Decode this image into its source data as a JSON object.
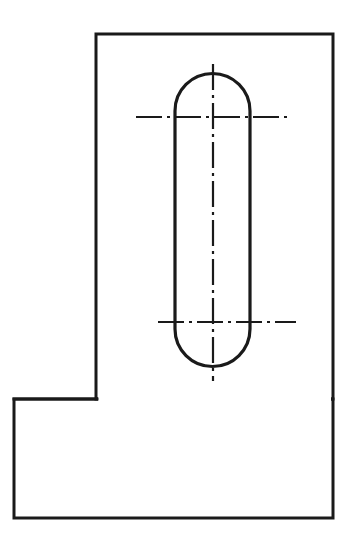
{
  "drawing": {
    "title": "Orthographic part view",
    "view_name": "front-view",
    "background_color": "#ffffff",
    "line_color": "#1a1a1a",
    "canvas": {
      "width": 358,
      "height": 544
    },
    "shapes": {
      "upright_plate": {
        "name": "upright-plate",
        "x": 96,
        "y": 34,
        "width": 237,
        "height": 365,
        "stroke_width": 3
      },
      "base_plate": {
        "name": "base-plate",
        "x": 14,
        "y": 399,
        "width": 319,
        "height": 119,
        "stroke_width": 3
      },
      "obround_slot": {
        "name": "obround-slot",
        "left_wall_x": 175,
        "right_wall_x": 250,
        "top_arc_center_y": 111,
        "bottom_arc_center_y": 329,
        "radius": 37.5,
        "top_apex_y": 73.5,
        "bottom_apex_y": 366.5,
        "stroke_width": 3.2,
        "path": "M 175 111 A 37.5 37.5 0 0 1 250 111 L 250 329 A 37.5 37.5 0 0 1 175 329 Z"
      }
    },
    "centerlines": {
      "vertical": {
        "name": "vertical-centerline",
        "x": 213,
        "y1": 64,
        "y2": 381,
        "style": "dash-dot"
      },
      "upper_horizontal": {
        "name": "upper-horizontal-centerline",
        "y": 117,
        "x1": 136,
        "x2": 292,
        "style": "dash-dot"
      },
      "lower_horizontal": {
        "name": "lower-horizontal-centerline",
        "y": 322,
        "x1": 158,
        "x2": 296,
        "style": "dash-dot"
      }
    }
  }
}
